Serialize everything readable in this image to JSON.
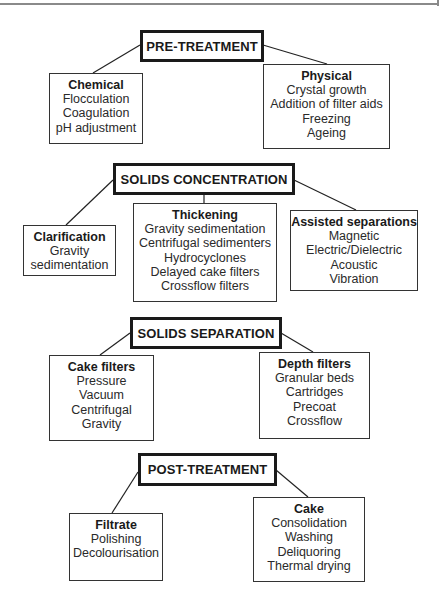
{
  "diagram": {
    "stages": [
      {
        "id": "pre-treatment",
        "label": "PRE-TREATMENT",
        "categories": [
          {
            "title": "Chemical",
            "items": [
              "Flocculation",
              "Coagulation",
              "pH adjustment"
            ]
          },
          {
            "title": "Physical",
            "items": [
              "Crystal growth",
              "Addition of filter aids",
              "Freezing",
              "Ageing"
            ]
          }
        ]
      },
      {
        "id": "solids-concentration",
        "label": "SOLIDS CONCENTRATION",
        "categories": [
          {
            "title": "Clarification",
            "items": [
              "Gravity",
              "sedimentation"
            ]
          },
          {
            "title": "Thickening",
            "items": [
              "Gravity sedimentation",
              "Centrifugal sedimenters",
              "Hydrocyclones",
              "Delayed cake filters",
              "Crossflow filters"
            ]
          },
          {
            "title": "Assisted separations",
            "items": [
              "Magnetic",
              "Electric/Dielectric",
              "Acoustic",
              "Vibration"
            ]
          }
        ]
      },
      {
        "id": "solids-separation",
        "label": "SOLIDS SEPARATION",
        "categories": [
          {
            "title": "Cake filters",
            "items": [
              "Pressure",
              "Vacuum",
              "Centrifugal",
              "Gravity"
            ]
          },
          {
            "title": "Depth filters",
            "items": [
              "Granular beds",
              "Cartridges",
              "Precoat",
              "Crossflow"
            ]
          }
        ]
      },
      {
        "id": "post-treatment",
        "label": "POST-TREATMENT",
        "categories": [
          {
            "title": "Filtrate",
            "items": [
              "Polishing",
              "Decolourisation"
            ]
          },
          {
            "title": "Cake",
            "items": [
              "Consolidation",
              "Washing",
              "Deliquoring",
              "Thermal drying"
            ]
          }
        ]
      }
    ]
  }
}
